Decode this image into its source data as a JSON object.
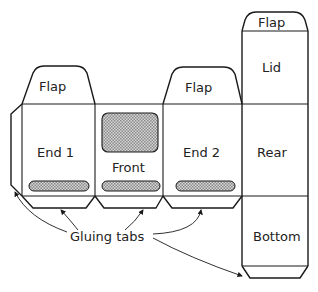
{
  "diagram": {
    "type": "box-net",
    "colors": {
      "line": "#1a1a1a",
      "text": "#222222",
      "hatch": "#b8b8b8",
      "background": "#ffffff"
    },
    "panels": {
      "end1": {
        "label": "End 1",
        "flap_label": "Flap"
      },
      "front": {
        "label": "Front"
      },
      "end2": {
        "label": "End 2",
        "flap_label": "Flap"
      },
      "lid": {
        "label": "Lid",
        "flap_label": "Flap"
      },
      "rear": {
        "label": "Rear"
      },
      "bottom": {
        "label": "Bottom"
      }
    },
    "annotation": {
      "label": "Gluing tabs"
    }
  }
}
